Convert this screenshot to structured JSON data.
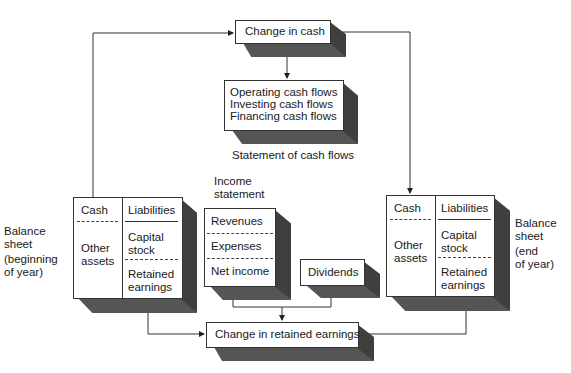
{
  "change_in_cash": {
    "label": "Change in cash"
  },
  "cash_flows": {
    "lines": [
      "Operating cash flows",
      "Investing cash flows",
      "Financing cash flows"
    ],
    "caption": "Statement of cash flows"
  },
  "balance_begin": {
    "side_label": [
      "Balance",
      "sheet",
      "(beginning",
      "of year)"
    ],
    "assets": {
      "cash": "Cash",
      "other": [
        "Other",
        "assets"
      ]
    },
    "claims": {
      "liabilities": "Liabilities",
      "capital": [
        "Capital",
        "stock"
      ],
      "retained": [
        "Retained",
        "earnings"
      ]
    }
  },
  "balance_end": {
    "side_label": [
      "Balance",
      "sheet",
      "(end",
      "of year)"
    ],
    "assets": {
      "cash": "Cash",
      "other": [
        "Other",
        "assets"
      ]
    },
    "claims": {
      "liabilities": "Liabilities",
      "capital": [
        "Capital",
        "stock"
      ],
      "retained": [
        "Retained",
        "earnings"
      ]
    }
  },
  "income_statement": {
    "title": [
      "Income",
      "statement"
    ],
    "rows": [
      "Revenues",
      "Expenses",
      "Net income"
    ]
  },
  "dividends": {
    "label": "Dividends"
  },
  "change_in_retained": {
    "label": "Change in retained earnings"
  }
}
